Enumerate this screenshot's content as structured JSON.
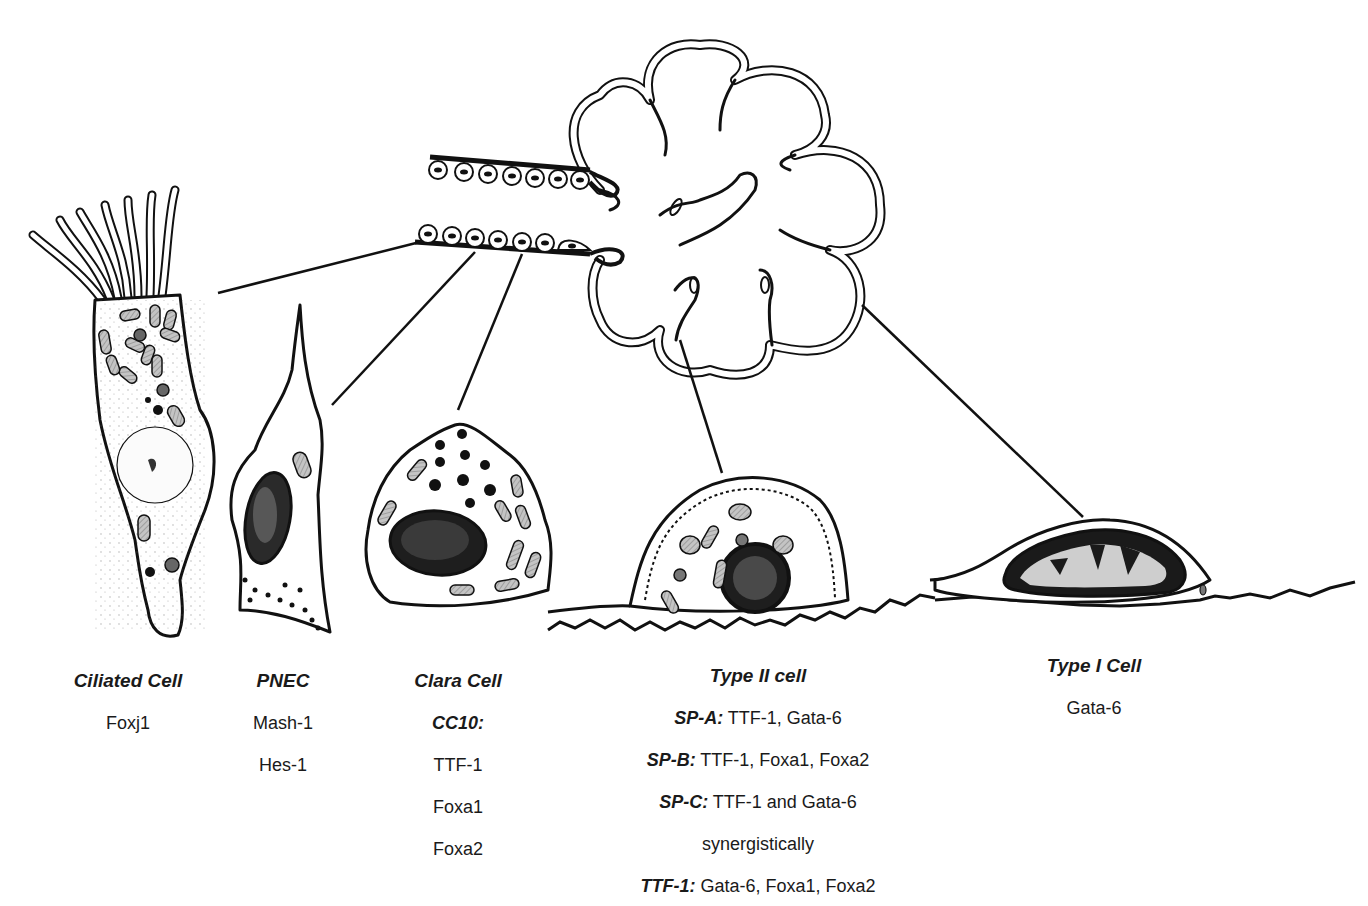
{
  "figure": {
    "colors": {
      "ink": "#111111",
      "cytoplasm": "#ffffff",
      "organelle": "#b5b5b5",
      "background": "#ffffff"
    }
  },
  "cells": [
    {
      "id": "ciliated",
      "title": "Ciliated Cell",
      "x": 128,
      "y": 670,
      "markers": [
        {
          "key": "",
          "value": "Foxj1"
        }
      ]
    },
    {
      "id": "pnec",
      "title": "PNEC",
      "x": 283,
      "y": 670,
      "markers": [
        {
          "key": "",
          "value": "Mash-1"
        },
        {
          "key": "",
          "value": "Hes-1"
        }
      ]
    },
    {
      "id": "clara",
      "title": "Clara Cell",
      "x": 458,
      "y": 670,
      "markers": [
        {
          "key": "CC10:",
          "value": ""
        },
        {
          "key": "",
          "value": "TTF-1"
        },
        {
          "key": "",
          "value": "Foxa1"
        },
        {
          "key": "",
          "value": "Foxa2"
        }
      ]
    },
    {
      "id": "type2",
      "title": "Type II cell",
      "x": 758,
      "y": 665,
      "markers": [
        {
          "key": "SP-A:",
          "value": " TTF-1, Gata-6"
        },
        {
          "key": "SP-B:",
          "value": " TTF-1, Foxa1, Foxa2"
        },
        {
          "key": "SP-C:",
          "value": " TTF-1 and Gata-6"
        },
        {
          "key": "",
          "value": "synergistically"
        },
        {
          "key": "TTF-1:",
          "value": " Gata-6, Foxa1, Foxa2"
        }
      ]
    },
    {
      "id": "type1",
      "title": "Type I Cell",
      "x": 1094,
      "y": 655,
      "markers": [
        {
          "key": "",
          "value": "Gata-6"
        }
      ]
    }
  ]
}
